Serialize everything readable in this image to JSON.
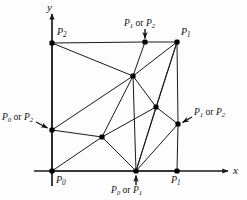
{
  "figure": {
    "type": "diagram",
    "axes": {
      "x_label": "x",
      "y_label": "y",
      "x_axis": {
        "x1": 34,
        "y1": 171,
        "x2": 228,
        "y2": 171,
        "arrow": true
      },
      "y_axis": {
        "x1": 52,
        "y1": 186,
        "x2": 52,
        "y2": 14,
        "arrow": true
      }
    },
    "vertices": [
      {
        "id": "p2_topleft",
        "x": 52,
        "y": 43,
        "dot": true
      },
      {
        "id": "p1orp2_top",
        "x": 145,
        "y": 42,
        "dot": true
      },
      {
        "id": "p1_topright",
        "x": 177,
        "y": 42,
        "dot": true
      },
      {
        "id": "p0orp2_left",
        "x": 52,
        "y": 130,
        "dot": true
      },
      {
        "id": "p1orp2_right",
        "x": 178,
        "y": 124,
        "dot": true
      },
      {
        "id": "p0_origin",
        "x": 52,
        "y": 171,
        "dot": true
      },
      {
        "id": "p0orp1_bottom",
        "x": 136,
        "y": 171,
        "dot": true
      },
      {
        "id": "p1_bottomright",
        "x": 177,
        "y": 171,
        "dot": true
      },
      {
        "id": "interior_upper",
        "x": 133,
        "y": 76,
        "dot": true
      },
      {
        "id": "interior_right",
        "x": 156,
        "y": 107,
        "dot": true
      },
      {
        "id": "interior_lower",
        "x": 102,
        "y": 137,
        "dot": true
      }
    ],
    "edges": [
      [
        "p2_topleft",
        "p1orp2_top"
      ],
      [
        "p1orp2_top",
        "p1_topright"
      ],
      [
        "p2_topleft",
        "p0orp2_left"
      ],
      [
        "p0orp2_left",
        "p0_origin"
      ],
      [
        "p0_origin",
        "p0orp1_bottom"
      ],
      [
        "p0orp1_bottom",
        "p1_bottomright"
      ],
      [
        "p1_topright",
        "p1orp2_right"
      ],
      [
        "p1orp2_right",
        "p1_bottomright"
      ],
      [
        "p2_topleft",
        "interior_upper"
      ],
      [
        "p1orp2_top",
        "interior_upper"
      ],
      [
        "p1_topright",
        "interior_upper"
      ],
      [
        "p1_topright",
        "interior_right"
      ],
      [
        "p1_topright",
        "p0orp1_bottom"
      ],
      [
        "interior_upper",
        "interior_right"
      ],
      [
        "interior_upper",
        "interior_lower"
      ],
      [
        "interior_upper",
        "p0orp1_bottom"
      ],
      [
        "interior_upper",
        "p0orp2_left"
      ],
      [
        "interior_right",
        "interior_lower"
      ],
      [
        "interior_right",
        "p1orp2_right"
      ],
      [
        "interior_right",
        "p0orp1_bottom"
      ],
      [
        "interior_lower",
        "p0orp2_left"
      ],
      [
        "interior_lower",
        "p0_origin"
      ],
      [
        "interior_lower",
        "p0orp1_bottom"
      ],
      [
        "p1orp2_right",
        "p0orp1_bottom"
      ]
    ],
    "labels": {
      "p2": {
        "base": "P",
        "sub": "2"
      },
      "p1": {
        "base": "P",
        "sub": "1"
      },
      "p0": {
        "base": "P",
        "sub": "0"
      },
      "p1_or_p2_top": {
        "first": "P",
        "first_sub": "1",
        "conj": " or ",
        "second": "P",
        "second_sub": "2"
      },
      "p0_or_p2_left": {
        "first": "P",
        "first_sub": "0",
        "conj": " or ",
        "second": "P",
        "second_sub": "2"
      },
      "p1_or_p2_right": {
        "first": "P",
        "first_sub": "1",
        "conj": " or ",
        "second": "P",
        "second_sub": "2"
      },
      "p0_or_p1_bottom": {
        "first": "P",
        "first_sub": "0",
        "conj": " or ",
        "second": "P",
        "second_sub": "1"
      },
      "p1_bottom": {
        "base": "P",
        "sub": "1"
      }
    },
    "style": {
      "line_color": "#1a1a1a",
      "dot_color": "#000000",
      "background": "#fdfdfd",
      "line_width": 1
    }
  }
}
